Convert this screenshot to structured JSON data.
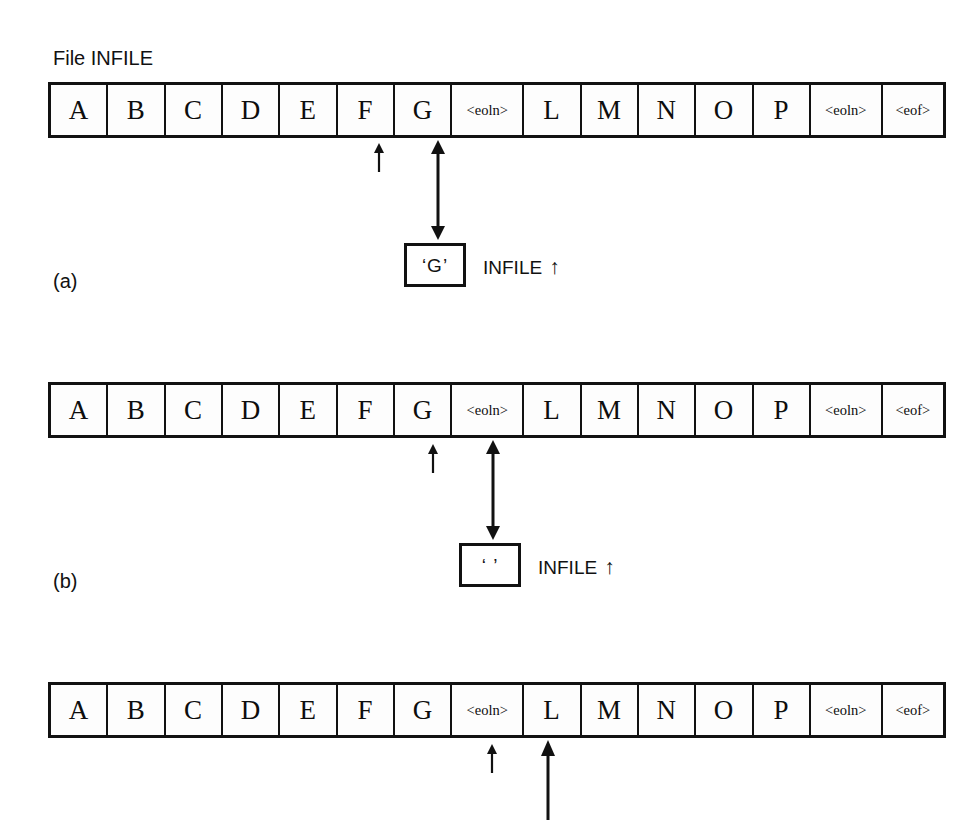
{
  "figure": {
    "background_color": "#ffffff",
    "ink_color": "#111111",
    "file_label": "File  INFILE",
    "pointer_glyph": "↑",
    "cells": [
      {
        "text": "A",
        "kind": "letter"
      },
      {
        "text": "B",
        "kind": "letter"
      },
      {
        "text": "C",
        "kind": "letter"
      },
      {
        "text": "D",
        "kind": "letter"
      },
      {
        "text": "E",
        "kind": "letter"
      },
      {
        "text": "F",
        "kind": "letter"
      },
      {
        "text": "G",
        "kind": "letter"
      },
      {
        "text": "<eoln>",
        "kind": "token"
      },
      {
        "text": "L",
        "kind": "letter"
      },
      {
        "text": "M",
        "kind": "letter"
      },
      {
        "text": "N",
        "kind": "letter"
      },
      {
        "text": "O",
        "kind": "letter"
      },
      {
        "text": "P",
        "kind": "letter"
      },
      {
        "text": "<eoln>",
        "kind": "token"
      },
      {
        "text": "<eof>",
        "kind": "token"
      }
    ],
    "panels": [
      {
        "id": "a",
        "label": "(a)",
        "caret_cell": "F",
        "buffer_cell": "G",
        "buffer_value": "‘G’",
        "buffer_caption": "INFILE",
        "buffer_caption_pointer": "↑"
      },
      {
        "id": "b",
        "label": "(b)",
        "caret_cell": "G",
        "buffer_cell": "<eoln>",
        "buffer_value": "‘ ’",
        "buffer_caption": "INFILE",
        "buffer_caption_pointer": "↑"
      },
      {
        "id": "c",
        "label": "",
        "caret_cell": "<eoln>",
        "buffer_cell": "L",
        "buffer_value": "",
        "buffer_caption": "",
        "buffer_caption_pointer": ""
      }
    ]
  }
}
